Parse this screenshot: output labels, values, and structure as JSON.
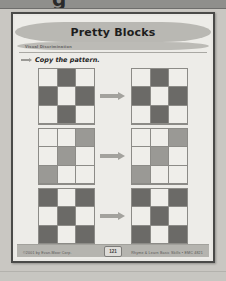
{
  "document": {
    "top_band_cut_text": "g",
    "title": "Pretty Blocks",
    "subtitle": "Visual Discrimination",
    "instruction": "Copy the pattern.",
    "instruction_marker_icon": "right-arrow-icon",
    "page_number": "121",
    "footer_left": "©2001 by Evan-Moor Corp.",
    "footer_right": "Rhyme & Learn Basic Skills • EMC 4821"
  },
  "colors": {
    "dark_block": "#6b6a67",
    "medium_block": "#9a9995",
    "light_block": "#efeeea",
    "grid_line": "#8c8b87",
    "arrow": "#a3a29d",
    "page_bg": "#edece8",
    "scan_bg": "#c9c7c2",
    "band": "#b9b8b3"
  },
  "exercises": [
    {
      "id": "exercise-1",
      "arrow_icon": "right-arrow-icon",
      "model_grid": {
        "rows": 3,
        "cols": 3,
        "cells": [
          [
            "light",
            "dark",
            "light"
          ],
          [
            "dark",
            "light",
            "dark"
          ],
          [
            "light",
            "dark",
            "light"
          ]
        ]
      },
      "copy_grid": {
        "rows": 3,
        "cols": 3,
        "cells": [
          [
            "light",
            "dark",
            "light"
          ],
          [
            "dark",
            "light",
            "dark"
          ],
          [
            "light",
            "dark",
            "light"
          ]
        ]
      }
    },
    {
      "id": "exercise-2",
      "arrow_icon": "right-arrow-icon",
      "model_grid": {
        "rows": 3,
        "cols": 3,
        "cells": [
          [
            "light",
            "light",
            "medium"
          ],
          [
            "light",
            "medium",
            "light"
          ],
          [
            "medium",
            "light",
            "light"
          ]
        ]
      },
      "copy_grid": {
        "rows": 3,
        "cols": 3,
        "cells": [
          [
            "light",
            "light",
            "medium"
          ],
          [
            "light",
            "medium",
            "light"
          ],
          [
            "medium",
            "light",
            "light"
          ]
        ]
      }
    },
    {
      "id": "exercise-3",
      "arrow_icon": "right-arrow-icon",
      "model_grid": {
        "rows": 3,
        "cols": 3,
        "cells": [
          [
            "dark",
            "light",
            "dark"
          ],
          [
            "light",
            "dark",
            "light"
          ],
          [
            "dark",
            "light",
            "dark"
          ]
        ]
      },
      "copy_grid": {
        "rows": 3,
        "cols": 3,
        "cells": [
          [
            "dark",
            "light",
            "dark"
          ],
          [
            "light",
            "dark",
            "light"
          ],
          [
            "dark",
            "light",
            "dark"
          ]
        ]
      }
    }
  ]
}
